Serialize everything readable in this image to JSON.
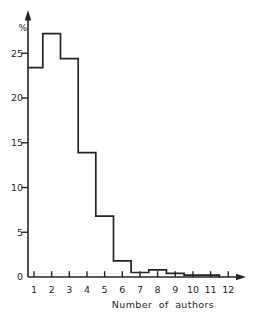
{
  "figure": {
    "background": "#ffffff",
    "line_color": "#242424",
    "text_color": "#1f1f1f"
  },
  "chart_data": {
    "type": "bar",
    "subtype": "step-histogram",
    "title": "",
    "ylabel": "%",
    "xlabel": "Number of authors",
    "x_ticks": [
      "1",
      "2",
      "3",
      "4",
      "5",
      "6",
      "7",
      "8",
      "9",
      "10",
      "11",
      "12"
    ],
    "y_ticks": [
      0,
      5,
      10,
      15,
      20,
      25
    ],
    "xlim": [
      0.66,
      13
    ],
    "ylim": [
      0,
      29.5
    ],
    "grid": false,
    "legend": "none",
    "bins": [
      {
        "from": 0.66,
        "to": 1.5,
        "pct": 23.4
      },
      {
        "from": 1.5,
        "to": 2.5,
        "pct": 27.2
      },
      {
        "from": 2.5,
        "to": 3.5,
        "pct": 24.4
      },
      {
        "from": 3.5,
        "to": 4.5,
        "pct": 13.9
      },
      {
        "from": 4.5,
        "to": 5.5,
        "pct": 6.8
      },
      {
        "from": 5.5,
        "to": 6.5,
        "pct": 1.8
      },
      {
        "from": 6.5,
        "to": 7.5,
        "pct": 0.5
      },
      {
        "from": 7.5,
        "to": 8.5,
        "pct": 0.8
      },
      {
        "from": 8.5,
        "to": 9.5,
        "pct": 0.4
      },
      {
        "from": 9.5,
        "to": 11.5,
        "pct": 0.2
      }
    ]
  }
}
